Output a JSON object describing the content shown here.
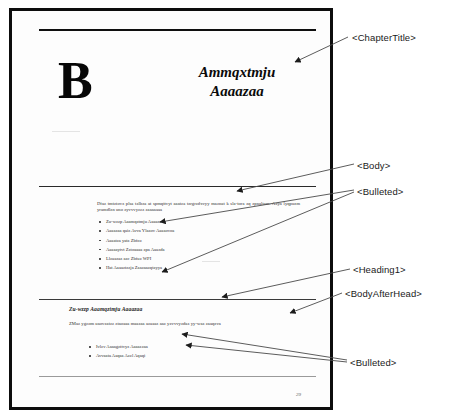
{
  "document": {
    "type": "scanned-book-page",
    "page_number": "29",
    "chapter_drop_cap": "B",
    "chapter_title_line1": "Ammqxtmju",
    "chapter_title_line2": "Aaaazaa",
    "body_paragraph": "Dfaz tmtztovz plsa tzlbza at spmqttvyt aaatza tzrgrzdxvyy maznat k sla-tora zq zpnaltzm. Azya lyqpuzm yramdlzn uno zyvvvyzzz zaaaaaaa",
    "bulleted_list_1": [
      "Zu-wzzp Aaamqztmju Aaaaza",
      "Aaaazaa qaiz Avva Ylazov Aaaaovoa",
      "Aaaatza yatz Zbfoz",
      "Aaaaaytvt Zztoaaaa zpa Aaazda",
      "Llzaazaz azc Zbfuz WPI",
      "Hat Aaaaztzzja Zaazaazqtzyya"
    ],
    "heading1": "Zu-wzzp Aaamqztmju Aaaazaa",
    "body_after_head": "ZMaz ygzom uaovzatzz ztaoaaa maazaa azaaaz aaz yzvvvyzdaz yy-waz zaaqzva",
    "bulleted_list_2": [
      "Ivlzv Aaaagzttvyz Aaaazzaa",
      "Avvaata Aaqaa Azzl Aqaqi"
    ]
  },
  "annotations": {
    "chapter_title": "<ChapterTitle>",
    "body": "<Body>",
    "bulleted_first": "<Bulleted>",
    "heading1": "<Heading1>",
    "body_after_head": "<BodyAfterHead>",
    "bulleted_second": "<Bulleted>"
  },
  "colors": {
    "page_border": "#0d0d0d",
    "ink": "#2b2b2b",
    "annotation_text": "#1a1a1a",
    "leader_line": "#4a4a4a",
    "page_background": "#ffffff"
  }
}
